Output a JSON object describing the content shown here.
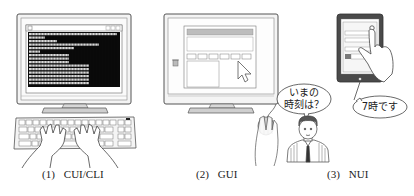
{
  "figure": {
    "panels": [
      {
        "id": "cui",
        "number": "(1)",
        "label": "CUI/CLI",
        "description": "Monitor showing black terminal with text rows; hands typing on keyboard"
      },
      {
        "id": "gui",
        "number": "(2)",
        "label": "GUI",
        "description": "Monitor showing window with buttons, trash icon and mouse pointer; hand on mouse"
      },
      {
        "id": "nui",
        "number": "(3)",
        "label": "NUI",
        "description": "Person speaking to tablet; finger touching tablet screen"
      }
    ],
    "nui_dialogue": {
      "question_line1": "いまの",
      "question_line2": "時刻は？",
      "answer": "7時です"
    }
  },
  "colors": {
    "line": "#555555",
    "bezel": "#f2f2f2",
    "terminal_bg": "#0a0a0a",
    "terminal_text": "#d8d8d8",
    "tablet_frame": "#4a4a4a",
    "accent_gray": "#9a9a9a"
  }
}
